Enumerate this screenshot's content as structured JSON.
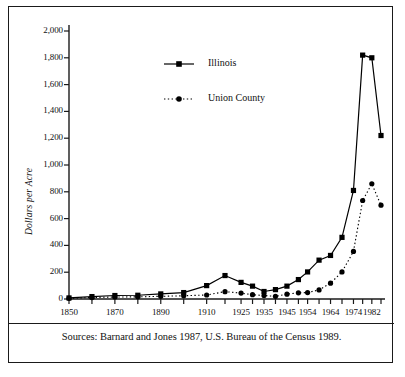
{
  "figure": {
    "caption": "Sources: Barnard and Jones 1987, U.S. Bureau of the Census 1989.",
    "frame_color": "#1a1a1a"
  },
  "chart_data": {
    "type": "line",
    "title": "",
    "xlabel": "",
    "ylabel": "Dollars per Acre",
    "ylim": [
      0,
      2000
    ],
    "ytick_labels": [
      "0",
      "200",
      "400",
      "600",
      "800",
      "1,000",
      "1,200",
      "1,400",
      "1,600",
      "1,800",
      "2,000"
    ],
    "ytick_values": [
      0,
      200,
      400,
      600,
      800,
      1000,
      1200,
      1400,
      1600,
      1800,
      2000
    ],
    "grid": false,
    "legend_position": "upper-center",
    "x": [
      1850,
      1860,
      1870,
      1880,
      1890,
      1900,
      1910,
      1918,
      1925,
      1930,
      1935,
      1940,
      1945,
      1950,
      1954,
      1959,
      1964,
      1969,
      1974,
      1978,
      1982,
      1986
    ],
    "xtick_labels": [
      "1850",
      "1870",
      "1890",
      "1910",
      "1925",
      "1935",
      "1945",
      "1954",
      "1964",
      "1974",
      "1982"
    ],
    "xtick_values": [
      1850,
      1870,
      1890,
      1910,
      1925,
      1935,
      1945,
      1954,
      1964,
      1974,
      1982
    ],
    "series": [
      {
        "name": "Illinois",
        "marker": "square",
        "linestyle": "solid",
        "color": "#000000",
        "values": [
          8,
          18,
          26,
          28,
          38,
          48,
          100,
          175,
          124,
          96,
          56,
          70,
          96,
          145,
          202,
          290,
          325,
          460,
          810,
          1820,
          1800,
          1220
        ]
      },
      {
        "name": "Union County",
        "marker": "circle",
        "linestyle": "dotted",
        "color": "#000000",
        "values": [
          5,
          11,
          15,
          16,
          20,
          24,
          30,
          55,
          44,
          32,
          26,
          20,
          36,
          46,
          48,
          68,
          118,
          202,
          355,
          735,
          860,
          700
        ]
      }
    ]
  },
  "legend": {
    "items": [
      {
        "label": "Illinois",
        "marker": "square",
        "linestyle": "solid"
      },
      {
        "label": "Union County",
        "marker": "circle",
        "linestyle": "dotted"
      }
    ]
  }
}
